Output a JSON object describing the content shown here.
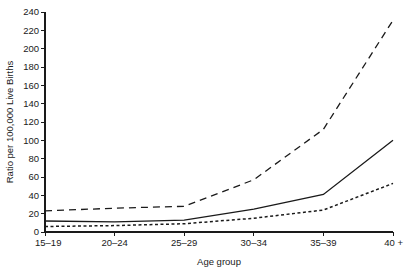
{
  "chart_data": {
    "type": "line",
    "title": "",
    "xlabel": "Age group",
    "ylabel": "Ratio per 100,000 Live Births",
    "categories": [
      "15–19",
      "20–24",
      "25–29",
      "30–34",
      "35–39",
      "40 +"
    ],
    "ylim": [
      0,
      240
    ],
    "yticks": [
      0,
      20,
      40,
      60,
      80,
      100,
      120,
      140,
      160,
      180,
      200,
      220,
      240
    ],
    "ytick_labels": [
      "0",
      "20",
      "40",
      "60",
      "80",
      "100",
      "120",
      "140",
      "160",
      "180",
      "200",
      "220",
      "240"
    ],
    "grid": false,
    "legend": "none",
    "series": [
      {
        "name": "upper-dashed-series",
        "style": "long-dashed",
        "dasharray": "7,5",
        "width": 1.3,
        "color": "#1a1a1a",
        "values": [
          23,
          26,
          28,
          57,
          112,
          231
        ]
      },
      {
        "name": "middle-solid-series",
        "style": "solid",
        "dasharray": "none",
        "width": 1.3,
        "color": "#1a1a1a",
        "values": [
          12,
          11,
          13,
          25,
          41,
          100
        ]
      },
      {
        "name": "lower-dotted-series",
        "style": "short-dashed",
        "dasharray": "3,2.5",
        "width": 1.5,
        "color": "#1a1a1a",
        "values": [
          6,
          7,
          9,
          15,
          24,
          53
        ]
      }
    ]
  },
  "layout": {
    "plot_left": 45,
    "plot_right": 393,
    "plot_top": 12,
    "plot_bottom": 232,
    "ylabel_x": 13,
    "ylabel_y": 122,
    "xlabel_x": 219,
    "xlabel_y": 265,
    "xtick_label_y": 246,
    "ytick_label_dx": -6,
    "tick_len": 4
  }
}
